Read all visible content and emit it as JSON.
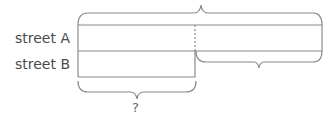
{
  "diagram": {
    "type": "tape-diagram",
    "bars": [
      {
        "label": "street A",
        "length_units": "full"
      },
      {
        "label": "street B",
        "length_units": "part"
      }
    ],
    "braces": [
      {
        "position": "top",
        "spans": "street A full length",
        "label": ""
      },
      {
        "position": "right-below-A",
        "spans": "difference between street A and street B",
        "label": ""
      },
      {
        "position": "bottom",
        "spans": "street B length",
        "label": "?"
      }
    ],
    "question_mark": "?",
    "colors": {
      "line": "#8a8a8a",
      "text": "#4a4a4a"
    }
  }
}
